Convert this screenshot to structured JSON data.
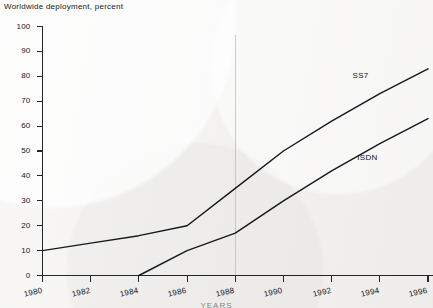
{
  "chart_data": {
    "type": "line",
    "title": "Worldwide deployment, percent",
    "xlabel": "YEARS",
    "ylabel": "",
    "x": [
      1980,
      1982,
      1984,
      1986,
      1988,
      1990,
      1992,
      1994,
      1996
    ],
    "categories": [
      "1980",
      "1982",
      "1984",
      "1986",
      "1988",
      "1990",
      "1992",
      "1994",
      "1996"
    ],
    "xlim": [
      1980,
      1996
    ],
    "ylim": [
      0,
      100
    ],
    "yticks": [
      0,
      10,
      20,
      30,
      40,
      50,
      60,
      70,
      80,
      90,
      100
    ],
    "ytick_labels": [
      "0",
      "10",
      "20",
      "30",
      "40",
      "50",
      "60",
      "70",
      "80",
      "90",
      "100"
    ],
    "grid": false,
    "legend": "inline-annotations",
    "series": [
      {
        "name": "SS7",
        "label": "SS7",
        "color": "#18191d",
        "values": [
          10,
          13,
          16,
          20,
          35,
          50,
          62,
          73,
          83
        ]
      },
      {
        "name": "ISDN",
        "label": "ISDN",
        "color": "#18191d",
        "values": [
          null,
          null,
          0,
          10,
          17,
          30,
          42,
          53,
          63
        ]
      }
    ],
    "annotations": [
      {
        "text": "SS7",
        "x": 1993.2,
        "y": 80
      },
      {
        "text": "ISDN",
        "x": 1993.4,
        "y": 47
      }
    ]
  },
  "style": {
    "background": "#f2f1ef",
    "ink": "#18191d",
    "faint_grid": "#b9b7b3"
  }
}
